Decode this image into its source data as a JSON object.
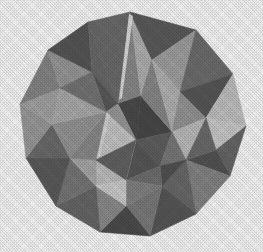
{
  "figure": {
    "name": "stellated-polyhedron",
    "title": "Stellated polyhedron",
    "medium": "halftone grayscale photographic plate",
    "background_color": "#ffffff",
    "canvas": {
      "width": 263,
      "height": 252
    },
    "rendering": {
      "style": "flat-shaded faceted solid",
      "outline": "none",
      "texture": "halftone screen dots"
    },
    "palette": {
      "darkest": "#4a4a4a",
      "dark": "#5c5c5c",
      "mid_dark": "#6e6e6e",
      "mid": "#838383",
      "mid_light": "#9a9a9a",
      "light": "#b4b4b4",
      "lightest": "#cccccc",
      "background": "#ffffff"
    },
    "silhouette": {
      "description": "irregular convex decagon",
      "bounds": {
        "left": 20,
        "top": 12,
        "right": 246,
        "bottom": 236
      },
      "points": "130,12 196,30 233,74 246,126 230,176 196,214 150,236 100,232 56,206 26,158 20,104 48,50 88,22"
    },
    "faces": [
      {
        "id": "f01",
        "tone": "#6e6e6e",
        "points": "130,12 88,22 118,104"
      },
      {
        "id": "f02",
        "tone": "#8e8e8e",
        "points": "130,12 118,104 141,96"
      },
      {
        "id": "f03",
        "tone": "#b6b6b6",
        "points": "130,12 141,96 152,60"
      },
      {
        "id": "f04",
        "tone": "#5e5e5e",
        "points": "130,12 152,60 196,30"
      },
      {
        "id": "f05",
        "tone": "#a4a4a4",
        "points": "196,30 152,60 180,92"
      },
      {
        "id": "f06",
        "tone": "#707070",
        "points": "196,30 180,92 233,74"
      },
      {
        "id": "f07",
        "tone": "#5a5a5a",
        "points": "233,74 180,92 206,118"
      },
      {
        "id": "f08",
        "tone": "#c6c6c6",
        "points": "233,74 206,118 246,126"
      },
      {
        "id": "f09",
        "tone": "#cfcfcf",
        "points": "246,126 206,118 216,150"
      },
      {
        "id": "f10",
        "tone": "#6a6a6a",
        "points": "246,126 216,150 230,176"
      },
      {
        "id": "f11",
        "tone": "#565656",
        "points": "230,176 216,150 186,160"
      },
      {
        "id": "f12",
        "tone": "#888888",
        "points": "230,176 186,160 196,214"
      },
      {
        "id": "f13",
        "tone": "#6c6c6c",
        "points": "196,214 186,160 162,186"
      },
      {
        "id": "f14",
        "tone": "#5a5a5a",
        "points": "196,214 162,186 150,236"
      },
      {
        "id": "f15",
        "tone": "#7e7e7e",
        "points": "150,236 162,186 126,206"
      },
      {
        "id": "f16",
        "tone": "#4e4e4e",
        "points": "150,236 126,206 100,232"
      },
      {
        "id": "f17",
        "tone": "#909090",
        "points": "100,232 126,206 96,186"
      },
      {
        "id": "f18",
        "tone": "#6a6a6a",
        "points": "100,232 96,186 56,206"
      },
      {
        "id": "f19",
        "tone": "#7a7a7a",
        "points": "56,206 96,186 70,158"
      },
      {
        "id": "f20",
        "tone": "#5e5e5e",
        "points": "56,206 70,158 26,158"
      },
      {
        "id": "f21",
        "tone": "#6e6e6e",
        "points": "26,158 70,158 52,124"
      },
      {
        "id": "f22",
        "tone": "#9e9e9e",
        "points": "26,158 52,124 20,104"
      },
      {
        "id": "f23",
        "tone": "#a8a8a8",
        "points": "20,104 52,124 60,88"
      },
      {
        "id": "f24",
        "tone": "#8a8a8a",
        "points": "20,104 60,88 48,50"
      },
      {
        "id": "f25",
        "tone": "#9c9c9c",
        "points": "48,50 60,88 92,72"
      },
      {
        "id": "f26",
        "tone": "#585858",
        "points": "48,50 92,72 88,22"
      },
      {
        "id": "f27",
        "tone": "#6c6c6c",
        "points": "88,22 92,72 118,104"
      },
      {
        "id": "f28",
        "tone": "#5c5c5c",
        "points": "118,104 92,72 106,112"
      },
      {
        "id": "f29",
        "tone": "#4c4c4c",
        "points": "141,96 118,104 136,140"
      },
      {
        "id": "f30",
        "tone": "#4a4a4a",
        "points": "141,96 136,140 172,132"
      },
      {
        "id": "f31",
        "tone": "#8c8c8c",
        "points": "152,60 141,96 172,132"
      },
      {
        "id": "f32",
        "tone": "#b8b8b8",
        "points": "180,92 152,60 172,132"
      },
      {
        "id": "f33",
        "tone": "#9a9a9a",
        "points": "206,118 180,92 172,132"
      },
      {
        "id": "f34",
        "tone": "#c2c2c2",
        "points": "206,118 172,132 186,160"
      },
      {
        "id": "f35",
        "tone": "#6e6e6e",
        "points": "216,150 206,118 186,160"
      },
      {
        "id": "f36",
        "tone": "#626262",
        "points": "172,132 136,140 160,166"
      },
      {
        "id": "f37",
        "tone": "#7c7c7c",
        "points": "186,160 172,132 160,166"
      },
      {
        "id": "f38",
        "tone": "#545454",
        "points": "162,186 186,160 160,166"
      },
      {
        "id": "f39",
        "tone": "#5a5a5a",
        "points": "160,166 136,140 126,180"
      },
      {
        "id": "f40",
        "tone": "#727272",
        "points": "162,186 160,166 126,180"
      },
      {
        "id": "f41",
        "tone": "#868686",
        "points": "126,206 162,186 126,180"
      },
      {
        "id": "f42",
        "tone": "#cacaca",
        "points": "136,140 106,112 96,160"
      },
      {
        "id": "f43",
        "tone": "#cfcfcf",
        "points": "126,180 136,140 96,160"
      },
      {
        "id": "f44",
        "tone": "#c4c4c4",
        "points": "96,186 126,180 96,160"
      },
      {
        "id": "f45",
        "tone": "#acacac",
        "points": "96,186 96,160 70,158"
      },
      {
        "id": "f46",
        "tone": "#8e8e8e",
        "points": "96,160 106,112 70,158"
      },
      {
        "id": "f47",
        "tone": "#9a9a9a",
        "points": "106,112 52,124 70,158"
      },
      {
        "id": "f48",
        "tone": "#b0b0b0",
        "points": "106,112 60,88 52,124"
      },
      {
        "id": "f49",
        "tone": "#787878",
        "points": "106,112 92,72 60,88"
      },
      {
        "id": "f50",
        "tone": "#9e9e9e",
        "points": "118,104 106,112 136,140"
      },
      {
        "id": "f51",
        "tone": "#d2d2d2",
        "points": "126,180 96,186 126,206"
      },
      {
        "id": "f52",
        "tone": "#656565",
        "points": "136,140 126,180 96,160"
      }
    ],
    "highlights": [
      {
        "id": "h1",
        "tone": "#e0e0e0",
        "points": "129,14 133,16 122,98 119,100"
      },
      {
        "id": "h2",
        "tone": "#dcdcdc",
        "points": "107,113 110,115 100,156 97,158"
      }
    ]
  }
}
